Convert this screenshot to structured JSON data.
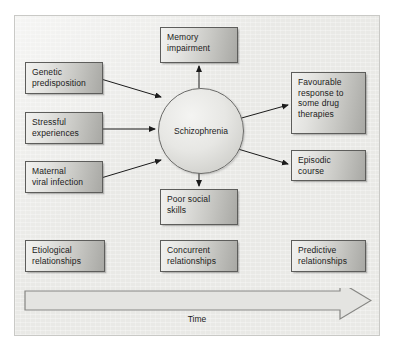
{
  "figure": {
    "center_node": {
      "label": "Schizophrenia"
    },
    "antecedent_nodes": [
      {
        "id": "genetic",
        "label": "Genetic\npredisposition"
      },
      {
        "id": "stress",
        "label": "Stressful\nexperiences"
      },
      {
        "id": "maternal",
        "label": "Maternal\nviral infection"
      }
    ],
    "concurrent_nodes": [
      {
        "id": "memory",
        "label": "Memory\nimpairment"
      },
      {
        "id": "social",
        "label": "Poor social\nskills"
      }
    ],
    "outcome_nodes": [
      {
        "id": "drug",
        "label": "Favourable\nresponse to\nsome drug\ntherapies"
      },
      {
        "id": "episodic",
        "label": "Episodic\ncourse"
      }
    ],
    "legend_nodes": [
      {
        "id": "etiological",
        "label": "Etiological\nrelationships"
      },
      {
        "id": "concurrent",
        "label": "Concurrent\nrelationships"
      },
      {
        "id": "predictive",
        "label": "Predictive\nrelationships"
      }
    ],
    "timeline": {
      "label": "Time",
      "direction": "left-to-right"
    },
    "colors": {
      "panel_background": "#e9e9e6",
      "node_border": "#5d5d5b",
      "node_fill_light": "#f2f2f0",
      "node_fill_dark": "#a8a8a4",
      "arrow_stroke": "#1b1b1b",
      "timeline_stroke": "#7c7c79",
      "text": "#1b1b1b"
    }
  }
}
